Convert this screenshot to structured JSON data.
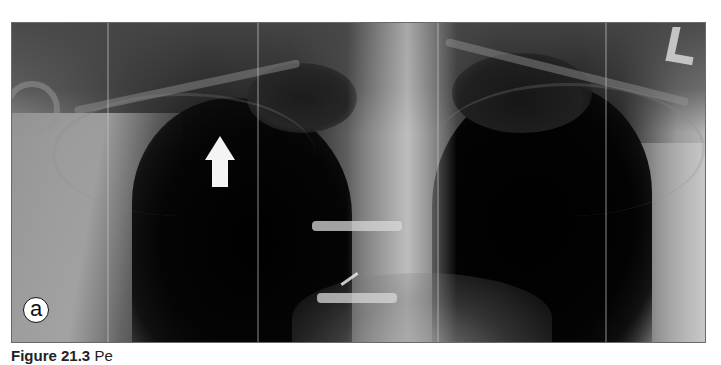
{
  "figure": {
    "image_type": "chest-x-ray",
    "panel_label": "a",
    "orientation_marker": "L",
    "annotation": "white-arrow-pointing-up",
    "caption": {
      "figure_number": "Figure 21.3",
      "text_visible": "Pe"
    }
  },
  "colors": {
    "background": "#ffffff",
    "frame_border": "#6a6a6a",
    "arrow": "#f4f4f4",
    "marker": "#c4c4c4",
    "caption_text": "#222222"
  }
}
